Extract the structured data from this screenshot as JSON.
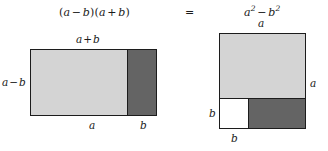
{
  "figure": {
    "equation": {
      "left_expression": {
        "open_paren": "(",
        "term1": "a",
        "operator1": "−",
        "term2": "b",
        "close_paren": ")",
        "open_paren2": "(",
        "term3": "a",
        "operator2": "+",
        "term4": "b",
        "close_paren2": ")",
        "full_text": "(a − b)(a + b)"
      },
      "equals_sign": "=",
      "right_expression": {
        "term1_base": "a",
        "term1_exponent": "2",
        "operator": "−",
        "term2_base": "b",
        "term2_exponent": "2",
        "full_text": "a² − b²"
      }
    },
    "left_diagram": {
      "name": "rectangle-a-plus-b-by-a-minus-b",
      "top_label": {
        "term1": "a",
        "operator": "+",
        "term2": "b",
        "full_text": "a + b"
      },
      "side_label": {
        "term1": "a",
        "operator": "−",
        "term2": "b",
        "full_text": "a − b"
      },
      "bottom_label_left": "a",
      "bottom_label_right": "b",
      "regions": [
        {
          "name": "light-region",
          "fill": "#d4d4d4",
          "width_label": "a"
        },
        {
          "name": "dark-region",
          "fill": "#646464",
          "width_label": "b"
        }
      ]
    },
    "right_diagram": {
      "name": "square-a-by-a",
      "top_label": "a",
      "right_label": "a",
      "left_label": "b",
      "bottom_label": "b",
      "regions": [
        {
          "name": "light-region-top",
          "fill": "#d4d4d4"
        },
        {
          "name": "white-region-bottom-left",
          "fill": "#ffffff"
        },
        {
          "name": "dark-region-bottom-right",
          "fill": "#646464"
        }
      ]
    },
    "colors": {
      "light_gray": "#d4d4d4",
      "dark_gray": "#646464",
      "white": "#ffffff",
      "stroke": "#1c1c1c",
      "text": "#1a1a1a",
      "background": "#ffffff"
    }
  }
}
